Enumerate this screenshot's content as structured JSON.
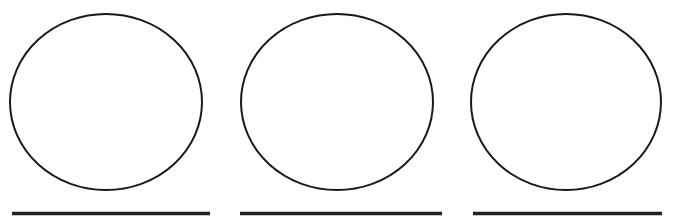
{
  "page": {
    "background_color": "#ffffff",
    "width": 675,
    "height": 221
  },
  "palette": {
    "ink": "#1a1a1a",
    "line_ink": "#222222",
    "paper": "#ffffff"
  },
  "figures": [
    {
      "id": "figure-1",
      "circle_label": "circle-1",
      "line_label": "answer-line-1",
      "circle": {
        "cx": 106,
        "cy": 102,
        "rx": 96,
        "ry": 88,
        "stroke": "#1a1a1a",
        "stroke_width": 2,
        "fill": "none"
      },
      "line": {
        "x1": 12,
        "x2": 210,
        "y": 213.5,
        "stroke": "#222222",
        "stroke_width": 3.5
      }
    },
    {
      "id": "figure-2",
      "circle_label": "circle-2",
      "line_label": "answer-line-2",
      "circle": {
        "cx": 337,
        "cy": 102,
        "rx": 96,
        "ry": 88,
        "stroke": "#1a1a1a",
        "stroke_width": 2,
        "fill": "none"
      },
      "line": {
        "x1": 240,
        "x2": 442,
        "y": 213.5,
        "stroke": "#222222",
        "stroke_width": 3.5
      }
    },
    {
      "id": "figure-3",
      "circle_label": "circle-3",
      "line_label": "answer-line-3",
      "circle": {
        "cx": 566,
        "cy": 102,
        "rx": 95,
        "ry": 88,
        "stroke": "#1a1a1a",
        "stroke_width": 2,
        "fill": "none"
      },
      "line": {
        "x1": 473,
        "x2": 662,
        "y": 213.5,
        "stroke": "#222222",
        "stroke_width": 3.5
      }
    }
  ]
}
